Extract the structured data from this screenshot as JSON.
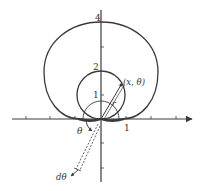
{
  "figure": {
    "colors": {
      "stroke": "#3a3a3a",
      "background": "#ffffff"
    },
    "y_ticks": [
      {
        "label": "4",
        "value": 4
      },
      {
        "label": "2",
        "value": 2
      },
      {
        "label": "1",
        "value": 1
      }
    ],
    "x_ticks": [
      {
        "label": "1",
        "value": 1
      }
    ],
    "labels": {
      "point": "(x, θ)",
      "radius": "r",
      "angle": "θ",
      "differential_angle": "dθ"
    }
  }
}
